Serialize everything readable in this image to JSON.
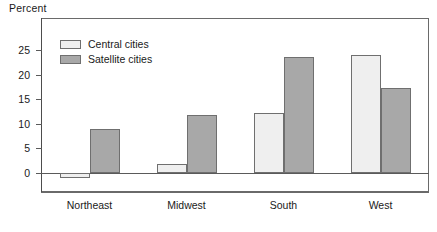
{
  "chart_data": {
    "type": "bar",
    "title": "",
    "ylabel": "Percent",
    "xlabel": "",
    "categories": [
      "Northeast",
      "Midwest",
      "South",
      "West"
    ],
    "series": [
      {
        "name": "Central cities",
        "values": [
          -1.0,
          1.8,
          12.2,
          23.9
        ],
        "color": "#efefef"
      },
      {
        "name": "Satellite cities",
        "values": [
          9.0,
          11.7,
          23.6,
          17.2
        ],
        "color": "#a8a8a8"
      }
    ],
    "yticks": [
      0,
      5,
      10,
      15,
      20,
      25
    ],
    "ylim": [
      -3,
      28
    ],
    "grid": false,
    "legend_position": "top-left",
    "tick_labels": {
      "y": [
        "0",
        "5",
        "10",
        "15",
        "20",
        "25"
      ],
      "x": [
        "Northeast",
        "Midwest",
        "South",
        "West"
      ]
    }
  },
  "legend": {
    "items": [
      {
        "label": "Central cities"
      },
      {
        "label": "Satellite cities"
      }
    ]
  },
  "axis": {
    "y_title": "Percent"
  }
}
